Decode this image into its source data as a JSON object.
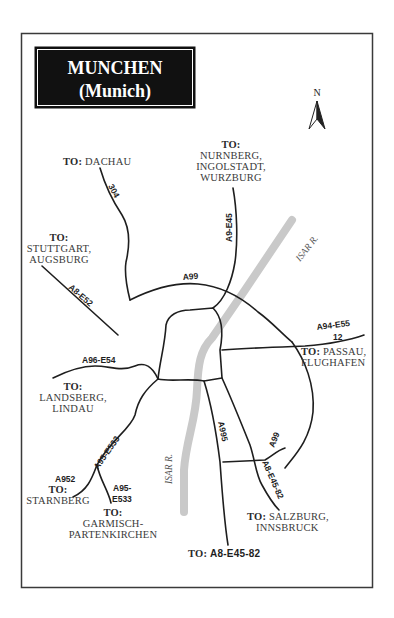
{
  "title": {
    "line1": "MUNCHEN",
    "line2": "(Munich)"
  },
  "compass": {
    "label": "N"
  },
  "river": {
    "label_upper": "ISAR R.",
    "label_lower": "ISAR R."
  },
  "destinations": {
    "dachau": {
      "to": "TO:",
      "line1": "DACHAU"
    },
    "nurnberg": {
      "to": "TO:",
      "line1": "NURNBERG,",
      "line2": "INGOLSTADT,",
      "line3": "WURZBURG"
    },
    "stuttgart": {
      "to": "TO:",
      "line1": "STUTTGART,",
      "line2": "AUGSBURG"
    },
    "passau": {
      "to": "TO:",
      "line1": "PASSAU,",
      "line2": "FLUGHAFEN"
    },
    "landsberg": {
      "to": "TO:",
      "line1": "LANDSBERG,",
      "line2": "LINDAU"
    },
    "starnberg": {
      "to": "TO:",
      "line1": "STARNBERG"
    },
    "garmisch": {
      "to": "TO:",
      "line1": "GARMISCH-",
      "line2": "PARTENKIRCHEN"
    },
    "salzburg": {
      "to": "TO:",
      "line1": "SALZBURG,",
      "line2": "INNSBRUCK"
    },
    "a8_south": {
      "to": "TO:",
      "line1": "A8-E45-82"
    }
  },
  "roads": {
    "r304": "304",
    "a9_e45": "A9-E45",
    "a99_north": "A99",
    "a8_e52": "A8-E52",
    "a94_e55": "A94-E55",
    "a94_num": "12",
    "a96_e54": "A96-E54",
    "a95_e533": "A95-E533",
    "a952": "A952",
    "a95_e533_split_1": "A95-",
    "a95_e533_split_2": "E533",
    "a995": "A995",
    "a99_south": "A99",
    "a8_e45_82": "A8-E45-82"
  },
  "colors": {
    "road": "#1e1e1e",
    "river": "#c9c9c9",
    "title_bg": "#111111",
    "frame": "#3a3a3a"
  }
}
